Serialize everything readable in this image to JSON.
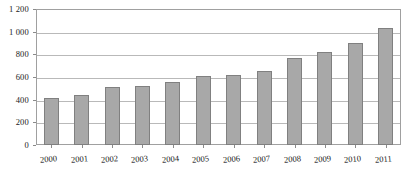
{
  "chart_data": {
    "type": "bar",
    "title": "",
    "xlabel": "",
    "ylabel": "",
    "categories": [
      "2000",
      "2001",
      "2002",
      "2003",
      "2004",
      "2005",
      "2006",
      "2007",
      "2008",
      "2009",
      "2010",
      "2011"
    ],
    "values": [
      415,
      445,
      510,
      520,
      560,
      605,
      620,
      650,
      770,
      820,
      900,
      1030
    ],
    "ylim": [
      0,
      1200
    ],
    "y_ticks": [
      0,
      200,
      400,
      600,
      800,
      1000,
      1200
    ],
    "y_tick_labels": [
      "0",
      "200",
      "400",
      "600",
      "800",
      "1 000",
      "1 200"
    ],
    "grid": true,
    "legend": "none",
    "series": [
      {
        "name": "",
        "values": [
          415,
          445,
          510,
          520,
          560,
          605,
          620,
          650,
          770,
          820,
          900,
          1030
        ]
      }
    ],
    "colors": {
      "bar_fill": "#a8a8a8",
      "bar_border": "#808080",
      "gridline": "#b9b9b9",
      "axis": "#a0a0a0",
      "text": "#1a1a1a",
      "background": "#ffffff"
    }
  }
}
